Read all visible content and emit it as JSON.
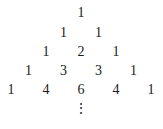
{
  "rows": [
    [
      "1"
    ],
    [
      "1",
      "1"
    ],
    [
      "1",
      "2",
      "1"
    ],
    [
      "1",
      "3",
      "3",
      "1"
    ],
    [
      "1",
      "4",
      "6",
      "4",
      "1"
    ]
  ],
  "continuation": "⋮"
}
